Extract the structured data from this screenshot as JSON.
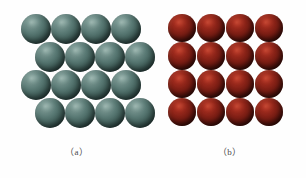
{
  "figure": {
    "background_color": "#fefefe",
    "width": 306,
    "height": 178,
    "panels": [
      {
        "id": "a",
        "caption": "（a）",
        "packing_type": "close-packed-offset-rows",
        "sphere_color_name": "slate-teal",
        "sphere_color": "#587873",
        "sphere_highlight_color": "#8fa9a3",
        "sphere_shadow_color": "#192a28",
        "rows": 4,
        "columns": 4,
        "sphere_count": 16,
        "sphere_diameter": 30,
        "row_offsets_px": [
          0,
          14,
          0,
          14
        ],
        "spheres": [
          {
            "cx": 36,
            "cy": 29
          },
          {
            "cx": 66,
            "cy": 29
          },
          {
            "cx": 96,
            "cy": 29
          },
          {
            "cx": 126,
            "cy": 29
          },
          {
            "cx": 50,
            "cy": 57
          },
          {
            "cx": 80,
            "cy": 57
          },
          {
            "cx": 110,
            "cy": 57
          },
          {
            "cx": 140,
            "cy": 57
          },
          {
            "cx": 36,
            "cy": 85
          },
          {
            "cx": 66,
            "cy": 85
          },
          {
            "cx": 96,
            "cy": 85
          },
          {
            "cx": 126,
            "cy": 85
          },
          {
            "cx": 50,
            "cy": 113
          },
          {
            "cx": 80,
            "cy": 113
          },
          {
            "cx": 110,
            "cy": 113
          },
          {
            "cx": 140,
            "cy": 113
          }
        ]
      },
      {
        "id": "b",
        "caption": "（b）",
        "packing_type": "simple-square-grid",
        "sphere_color_name": "dark-maroon-red",
        "sphere_color": "#8a2318",
        "sphere_highlight_color": "#b8392a",
        "sphere_shadow_color": "#2a0a06",
        "rows": 4,
        "columns": 4,
        "sphere_count": 16,
        "sphere_diameter": 28,
        "row_offsets_px": [
          0,
          0,
          0,
          0
        ],
        "spheres": [
          {
            "cx": 29,
            "cy": 28
          },
          {
            "cx": 58,
            "cy": 28
          },
          {
            "cx": 87,
            "cy": 28
          },
          {
            "cx": 116,
            "cy": 28
          },
          {
            "cx": 29,
            "cy": 56
          },
          {
            "cx": 58,
            "cy": 56
          },
          {
            "cx": 87,
            "cy": 56
          },
          {
            "cx": 116,
            "cy": 56
          },
          {
            "cx": 29,
            "cy": 84
          },
          {
            "cx": 58,
            "cy": 84
          },
          {
            "cx": 87,
            "cy": 84
          },
          {
            "cx": 116,
            "cy": 84
          },
          {
            "cx": 29,
            "cy": 112
          },
          {
            "cx": 58,
            "cy": 112
          },
          {
            "cx": 87,
            "cy": 112
          },
          {
            "cx": 116,
            "cy": 112
          }
        ]
      }
    ]
  }
}
